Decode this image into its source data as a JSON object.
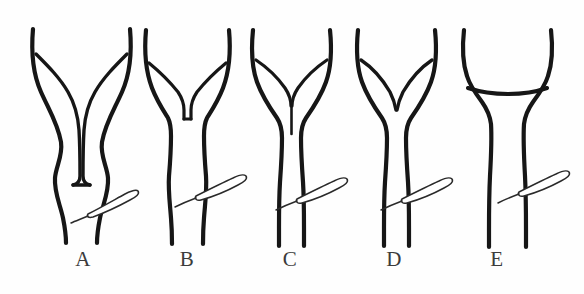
{
  "figure": {
    "background_color": "#fefefe",
    "stroke_color": "#161616",
    "label_color": "#3b3b3b",
    "width": 584,
    "height": 294,
    "panel_count": 5
  },
  "panels": [
    {
      "label": "A",
      "label_x": 83,
      "label_y": 266,
      "variant": "complete-septate-long-septum",
      "description": "Two long narrow horns with a deep central septum extending to the cervix",
      "instrument": "catheter-loop"
    },
    {
      "label": "B",
      "label_x": 187,
      "label_y": 266,
      "variant": "partial-septate-short-squared-septum",
      "description": "Two splayed horns meeting at a short squared-off central septum",
      "instrument": "catheter-loop"
    },
    {
      "label": "C",
      "label_x": 290,
      "label_y": 266,
      "variant": "subseptate-thin-septum",
      "description": "Two horns converging to a thin vertical septal line",
      "instrument": "catheter-loop"
    },
    {
      "label": "D",
      "label_x": 394,
      "label_y": 266,
      "variant": "arcuate-v-notch",
      "description": "Shallow V-shaped fundal notch without a septum",
      "instrument": "catheter-loop"
    },
    {
      "label": "E",
      "label_x": 497,
      "label_y": 266,
      "variant": "normal-flat-fundus",
      "description": "Normal triangular cavity with a flat fundus",
      "instrument": "catheter-loop"
    }
  ],
  "instrument": {
    "name": "catheter-loop",
    "shape": "elongated thin loop angled upward to the right crossing the cervical canal",
    "fill_color": "#ffffff",
    "stroke_color": "#2a2a2a"
  }
}
